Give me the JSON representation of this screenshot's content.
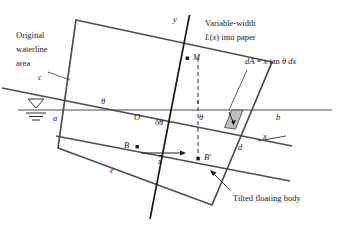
{
  "figure": {
    "type": "engineering-diagram",
    "stroke_color": "#4d4d4d",
    "axis_color": "#1a1a1a",
    "wedge_fill": "#bfbfbf",
    "background": "#ffffff"
  },
  "annotations": {
    "original_waterline_area": {
      "line1": "Original",
      "line2": "waterline",
      "line3": "area"
    },
    "variable_width": {
      "line1": "Variable-width",
      "line2_italic": "L",
      "line2_paren_open": "(",
      "line2_var": "x",
      "line2_paren_close": ")",
      "line2_rest": " into paper"
    },
    "dA_equation": {
      "dA": "dA",
      "equals": " = ",
      "x": "x",
      "tan": " tan ",
      "theta": "θ",
      "dx": " dx"
    },
    "tilted_floating_body": "Tilted floating body"
  },
  "labels": {
    "point_a": "a",
    "point_b_right": "b",
    "point_c": "c",
    "point_d": "d",
    "point_e": "e",
    "point_O": "O",
    "point_M": "M",
    "point_B": "B",
    "point_Bprime": "B′",
    "axis_x": "x",
    "axis_y": "y",
    "theta_left": "θ",
    "theta_right": "θ",
    "delta_theta": "δθ",
    "x_bar": "x"
  },
  "geometry": {
    "waterline_y": 110,
    "waterline_x_start": 18,
    "waterline_x_end": 330,
    "tilt_angle_deg": 13,
    "body_corners": {
      "top_left": "(76,20)",
      "top_right": "(272,62)",
      "bottom_right": "(212,205)",
      "bottom_left": "(58,148)"
    },
    "tilted_waterline_left": "(2,88)",
    "tilted_waterline_right": "(290,145)",
    "y_axis_top": "(188,14)",
    "y_axis_bottom": "(151,218)",
    "x_axis_left": "(100,97)",
    "x_axis_right": "(282,132)",
    "wedge_fill_region": "x in [222,244], along tilted waterline"
  }
}
